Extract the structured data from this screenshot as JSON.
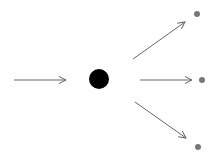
{
  "diagram": {
    "type": "fan-out",
    "colors": {
      "background": "#ffffff",
      "arrow": "#666666",
      "center_node": "#000000",
      "target_node": "#777777"
    },
    "center_node": {
      "cx": 99,
      "cy": 79,
      "r": 10
    },
    "input_arrow": {
      "x1": 14,
      "y1": 80,
      "x2": 66,
      "y2": 80
    },
    "outputs": [
      {
        "arrow": {
          "x1": 133,
          "y1": 59,
          "x2": 185,
          "y2": 22
        },
        "node": {
          "cx": 197,
          "cy": 14,
          "r": 3
        }
      },
      {
        "arrow": {
          "x1": 140,
          "y1": 80,
          "x2": 192,
          "y2": 80
        },
        "node": {
          "cx": 202,
          "cy": 80,
          "r": 3
        }
      },
      {
        "arrow": {
          "x1": 135,
          "y1": 102,
          "x2": 186,
          "y2": 138
        },
        "node": {
          "cx": 198,
          "cy": 147,
          "r": 3
        }
      }
    ]
  }
}
